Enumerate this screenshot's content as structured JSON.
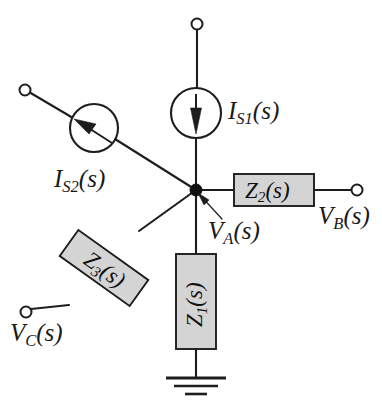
{
  "diagram": {
    "background_color": "#ffffff",
    "line_color": "#1d1d1d",
    "box_fill_color": "#d4d4d4"
  },
  "labels": {
    "is1": {
      "symbol": "I",
      "sub": "S1",
      "arg": "(s)",
      "full": "I_S1(s)"
    },
    "is2": {
      "symbol": "I",
      "sub": "S2",
      "arg": "(s)",
      "full": "I_S2(s)"
    },
    "va": {
      "symbol": "V",
      "sub": "A",
      "arg": "(s)",
      "full": "V_A(s)"
    },
    "vb": {
      "symbol": "V",
      "sub": "B",
      "arg": "(s)",
      "full": "V_B(s)"
    },
    "vc": {
      "symbol": "V",
      "sub": "C",
      "arg": "(s)",
      "full": "V_C(s)"
    },
    "z1": {
      "symbol": "Z",
      "sub": "1",
      "arg": "(s)",
      "full": "Z_1(s)"
    },
    "z2": {
      "symbol": "Z",
      "sub": "2",
      "arg": "(s)",
      "full": "Z_2(s)"
    },
    "z3": {
      "symbol": "Z",
      "sub": "3",
      "arg": "(s)",
      "full": "Z_3(s)"
    }
  },
  "components": {
    "current_source_1": {
      "name": "IS1",
      "kind": "current-source",
      "cx": 196,
      "cy": 113,
      "r": 25,
      "arrow_direction": "down"
    },
    "current_source_2": {
      "name": "IS2",
      "kind": "current-source",
      "cx": 94,
      "cy": 128,
      "r": 24,
      "arrow_direction": "up-left"
    },
    "impedance_1": {
      "name": "Z1",
      "kind": "impedance-box",
      "orientation": "vertical",
      "x": 176,
      "y": 254,
      "w": 40,
      "h": 95
    },
    "impedance_2": {
      "name": "Z2",
      "kind": "impedance-box",
      "orientation": "horizontal",
      "x": 234,
      "y": 174,
      "w": 80,
      "h": 32
    },
    "impedance_3": {
      "name": "Z3",
      "kind": "impedance-box",
      "orientation": "diagonal",
      "cx": 104,
      "cy": 268,
      "w": 86,
      "h": 32,
      "angle_deg": 35.6
    },
    "ground": {
      "name": "ground",
      "kind": "ground-symbol",
      "x": 196,
      "y": 378
    },
    "node_a": {
      "name": "node-A",
      "kind": "junction-dot",
      "x": 196,
      "y": 190,
      "r": 6
    }
  },
  "terminals": [
    {
      "name": "terminal-top",
      "x": 197,
      "y": 24,
      "r": 5.5
    },
    {
      "name": "terminal-upper-left",
      "x": 25,
      "y": 90,
      "r": 5.5
    },
    {
      "name": "terminal-vb",
      "x": 357,
      "y": 190,
      "r": 5.5
    },
    {
      "name": "terminal-vc",
      "x": 26,
      "y": 312,
      "r": 5.5
    }
  ]
}
